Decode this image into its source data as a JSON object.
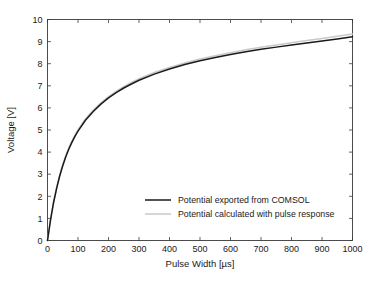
{
  "chart_data": {
    "type": "line",
    "title": "",
    "subtitle": "",
    "xlabel": "Pulse Width [µs]",
    "ylabel": "Voltage [V]",
    "xlim": [
      0,
      1000
    ],
    "ylim": [
      0,
      10
    ],
    "grid": false,
    "legend_position": "center",
    "xticks": [
      0,
      100,
      200,
      300,
      400,
      500,
      600,
      700,
      800,
      900,
      1000
    ],
    "xtick_labels": [
      "0",
      "100",
      "200",
      "300",
      "400",
      "500",
      "600",
      "700",
      "800",
      "900",
      "1000"
    ],
    "yticks": [
      0,
      1,
      2,
      3,
      4,
      5,
      6,
      7,
      8,
      9,
      10
    ],
    "ytick_labels": [
      "0",
      "1",
      "2",
      "3",
      "4",
      "5",
      "6",
      "7",
      "8",
      "9",
      "10"
    ],
    "x": [
      0,
      10,
      20,
      30,
      40,
      50,
      60,
      70,
      80,
      90,
      100,
      125,
      150,
      175,
      200,
      225,
      250,
      275,
      300,
      350,
      400,
      450,
      500,
      550,
      600,
      650,
      700,
      750,
      800,
      850,
      900,
      950,
      1000
    ],
    "series": [
      {
        "name": "Potential exported from COMSOL",
        "color": "#1a1a1a",
        "line_width": 1.5,
        "values": [
          0.0,
          0.93,
          1.72,
          2.36,
          2.92,
          3.38,
          3.79,
          4.14,
          4.44,
          4.71,
          4.95,
          5.45,
          5.84,
          6.17,
          6.45,
          6.69,
          6.9,
          7.08,
          7.25,
          7.53,
          7.76,
          7.96,
          8.13,
          8.28,
          8.42,
          8.54,
          8.65,
          8.75,
          8.85,
          8.94,
          9.03,
          9.12,
          9.22
        ]
      },
      {
        "name": "Potential calculated with pulse response",
        "color": "#c9c9c9",
        "line_width": 1.5,
        "values": [
          0.0,
          0.96,
          1.76,
          2.41,
          2.97,
          3.44,
          3.85,
          4.2,
          4.5,
          4.77,
          5.01,
          5.51,
          5.9,
          6.23,
          6.51,
          6.75,
          6.96,
          7.15,
          7.32,
          7.6,
          7.83,
          8.03,
          8.21,
          8.36,
          8.5,
          8.63,
          8.74,
          8.85,
          8.95,
          9.05,
          9.14,
          9.24,
          9.34
        ]
      }
    ],
    "legend_entries": [
      {
        "label": "Potential exported from COMSOL",
        "color": "#1a1a1a"
      },
      {
        "label": "Potential calculated with pulse response",
        "color": "#c9c9c9"
      }
    ]
  }
}
